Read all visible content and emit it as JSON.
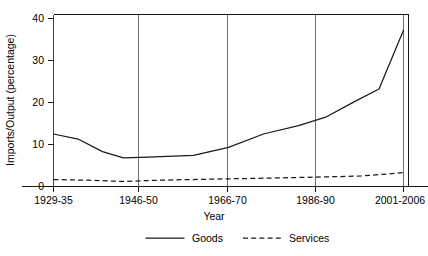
{
  "chart_data": {
    "type": "line",
    "title": "",
    "xlabel": "Year",
    "ylabel": "Imports/Output (percentage)",
    "categories": [
      "1929-35",
      "1946-50",
      "1966-70",
      "1986-90",
      "2001-2006"
    ],
    "x_tick_labels": [
      "1929-35",
      "1946-50",
      "1966-70",
      "1986-90",
      "2001-2006"
    ],
    "y_tick_labels": [
      "0",
      "10",
      "20",
      "30",
      "40"
    ],
    "y_ticks": [
      0,
      10,
      20,
      30,
      40
    ],
    "ylim": [
      0,
      41.5
    ],
    "xlim": [
      0,
      100
    ],
    "grid": "vertical-only",
    "legend_position": "bottom-center",
    "series": [
      {
        "name": "Goods",
        "style": "solid",
        "color": "#1a1a1a",
        "x": [
          0.0,
          7.0,
          14.0,
          20.0,
          27.0,
          40.0,
          50.0,
          60.0,
          70.0,
          78.0,
          86.0,
          93.0,
          100.0
        ],
        "values": [
          12.5,
          11.3,
          8.3,
          6.8,
          7.0,
          7.4,
          9.3,
          12.5,
          14.5,
          16.6,
          20.2,
          23.2,
          37.2
        ]
      },
      {
        "name": "Services",
        "style": "dashed",
        "color": "#1a1a1a",
        "x": [
          0.0,
          10.0,
          20.0,
          30.0,
          42.0,
          55.0,
          68.0,
          78.0,
          88.0,
          100.0
        ],
        "values": [
          1.65,
          1.5,
          1.2,
          1.5,
          1.7,
          1.9,
          2.1,
          2.3,
          2.5,
          3.3
        ]
      }
    ],
    "legend": [
      {
        "label": "Goods",
        "style": "solid"
      },
      {
        "label": "Services",
        "style": "dashed"
      }
    ]
  }
}
